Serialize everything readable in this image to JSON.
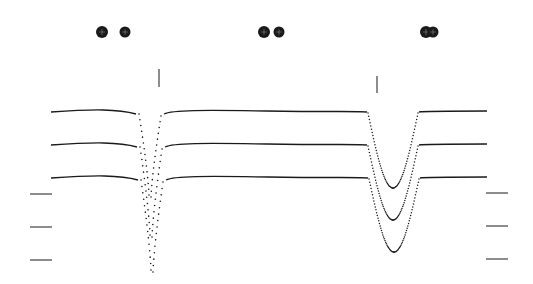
{
  "figure": {
    "width": 533,
    "height": 284,
    "background": "#ffffff",
    "ink": "#1a1a1a"
  },
  "chart_data": {
    "type": "line",
    "title": "",
    "xlabel": "",
    "ylabel": "",
    "grid": false,
    "legend": "none",
    "eclipse_markers": [
      {
        "name": "primary-eclipse-marker",
        "x": 159,
        "y1": 69,
        "y2": 87
      },
      {
        "name": "secondary-eclipse-marker",
        "x": 377,
        "y1": 76,
        "y2": 93
      }
    ],
    "series": [
      {
        "name": "curve-1",
        "baseline_y": 111,
        "x_start": 51,
        "x_end": 487,
        "primary_dip": {
          "center_x": 150,
          "depth_y": 195,
          "half_width": 12
        },
        "secondary_dip": {
          "center_x": 393,
          "depth_y": 188,
          "half_width": 22
        }
      },
      {
        "name": "curve-2",
        "baseline_y": 144,
        "x_start": 51,
        "x_end": 487,
        "primary_dip": {
          "center_x": 151,
          "depth_y": 235,
          "half_width": 12
        },
        "secondary_dip": {
          "center_x": 393,
          "depth_y": 220,
          "half_width": 22
        }
      },
      {
        "name": "curve-3",
        "baseline_y": 177,
        "x_start": 51,
        "x_end": 487,
        "primary_dip": {
          "center_x": 152,
          "depth_y": 270,
          "half_width": 12
        },
        "secondary_dip": {
          "center_x": 394,
          "depth_y": 252,
          "half_width": 22
        }
      }
    ],
    "left_ticks_y": [
      194,
      227,
      260
    ],
    "right_ticks_y": [
      193,
      226,
      259
    ],
    "tick_x_left": [
      30,
      52
    ],
    "tick_x_right": [
      486,
      508
    ],
    "schematic_configurations": [
      {
        "label": "separated",
        "stars": [
          {
            "cx": 102,
            "cy": 32,
            "r": 6
          },
          {
            "cx": 125,
            "cy": 32,
            "r": 5.5
          }
        ]
      },
      {
        "label": "approaching",
        "stars": [
          {
            "cx": 264,
            "cy": 32,
            "r": 6
          },
          {
            "cx": 279,
            "cy": 32,
            "r": 5.5
          }
        ]
      },
      {
        "label": "overlapping",
        "stars": [
          {
            "cx": 426,
            "cy": 32,
            "r": 6
          },
          {
            "cx": 433,
            "cy": 32,
            "r": 5.5
          }
        ]
      }
    ]
  }
}
